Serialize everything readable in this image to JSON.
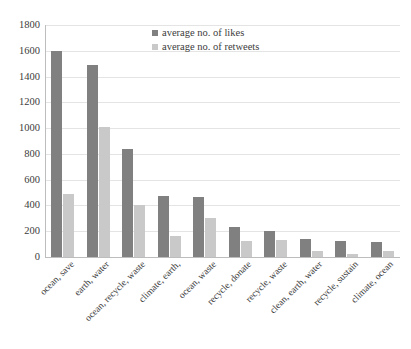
{
  "chart_data": {
    "type": "bar",
    "title": "",
    "xlabel": "",
    "ylabel": "",
    "ylim": [
      0,
      1800
    ],
    "yticks": [
      1800,
      1600,
      1400,
      1200,
      1000,
      800,
      600,
      400,
      200,
      0
    ],
    "grid": true,
    "legend_position": "top-center",
    "categories": [
      "ocean, save",
      "earth, water",
      "ocean, recycle, waste",
      "climate, earth,",
      "ocean, waste",
      "recycle, donate",
      "recycle, waste",
      "clean, earth, water",
      "recycle, sustain",
      "climate, ocean"
    ],
    "series": [
      {
        "name": "average no. of likes",
        "color": "#808080",
        "values": [
          1595,
          1490,
          835,
          470,
          465,
          230,
          205,
          140,
          125,
          120
        ]
      },
      {
        "name": "average no. of retweets",
        "color": "#c9c9c9",
        "values": [
          490,
          1005,
          400,
          165,
          300,
          125,
          135,
          50,
          25,
          50
        ]
      }
    ]
  }
}
